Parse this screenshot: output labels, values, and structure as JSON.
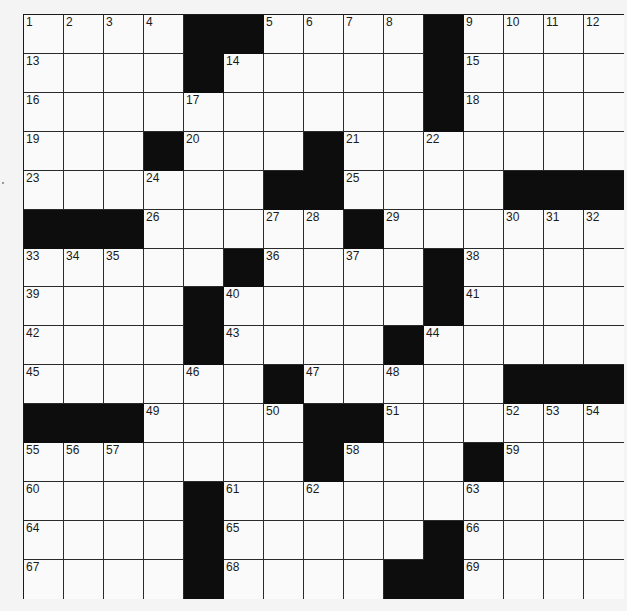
{
  "puzzle": {
    "size": {
      "rows": 15,
      "cols": 15
    },
    "colors": {
      "black_cell": "#0d0d0d",
      "white_cell": "#fafafa",
      "line": "#2a2a2a"
    },
    "grid": [
      [
        "1",
        "2",
        "3",
        "4",
        "#",
        "#",
        "5",
        "6",
        "7",
        "8",
        "#",
        "9",
        "10",
        "11",
        "12"
      ],
      [
        "13",
        "",
        "",
        "",
        "#",
        "14",
        "",
        "",
        "",
        "",
        "#",
        "15",
        "",
        "",
        ""
      ],
      [
        "16",
        "",
        "",
        "",
        "17",
        "",
        "",
        "",
        "",
        "",
        "#",
        "18",
        "",
        "",
        ""
      ],
      [
        "19",
        "",
        "",
        "#",
        "20",
        "",
        "",
        "#",
        "21",
        "",
        "22",
        "",
        "",
        "",
        ""
      ],
      [
        "23",
        "",
        "",
        "24",
        "",
        "",
        "#",
        "#",
        "25",
        "",
        "",
        "",
        "#",
        "#",
        "#"
      ],
      [
        "#",
        "#",
        "#",
        "26",
        "",
        "",
        "27",
        "28",
        "#",
        "29",
        "",
        "",
        "30",
        "31",
        "32"
      ],
      [
        "33",
        "34",
        "35",
        "",
        "",
        "#",
        "36",
        "",
        "37",
        "",
        "#",
        "38",
        "",
        "",
        ""
      ],
      [
        "39",
        "",
        "",
        "",
        "#",
        "40",
        "",
        "",
        "",
        "",
        "#",
        "41",
        "",
        "",
        ""
      ],
      [
        "42",
        "",
        "",
        "",
        "#",
        "43",
        "",
        "",
        "",
        "#",
        "44",
        "",
        "",
        "",
        ""
      ],
      [
        "45",
        "",
        "",
        "",
        "46",
        "",
        "#",
        "47",
        "",
        "48",
        "",
        "",
        "#",
        "#",
        "#"
      ],
      [
        "#",
        "#",
        "#",
        "49",
        "",
        "",
        "50",
        "#",
        "#",
        "51",
        "",
        "",
        "52",
        "53",
        "54"
      ],
      [
        "55",
        "56",
        "57",
        "",
        "",
        "",
        "",
        "#",
        "58",
        "",
        "",
        "#",
        "59",
        "",
        ""
      ],
      [
        "60",
        "",
        "",
        "",
        "#",
        "61",
        "",
        "62",
        "",
        "",
        "",
        "63",
        "",
        "",
        ""
      ],
      [
        "64",
        "",
        "",
        "",
        "#",
        "65",
        "",
        "",
        "",
        "",
        "#",
        "66",
        "",
        "",
        ""
      ],
      [
        "67",
        "",
        "",
        "",
        "#",
        "68",
        "",
        "",
        "",
        "#",
        "#",
        "69",
        "",
        "",
        ""
      ]
    ]
  }
}
